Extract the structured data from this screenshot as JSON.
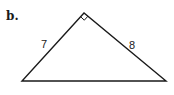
{
  "problem": {
    "label": "b."
  },
  "triangle": {
    "vertices": {
      "apex": [
        84,
        13
      ],
      "bottom_left": [
        22,
        81
      ],
      "bottom_right": [
        166,
        81
      ]
    },
    "right_angle_at": "apex",
    "sides": {
      "left": "7",
      "right": "8",
      "base": ""
    },
    "stroke_color": "#1a1a1a"
  }
}
